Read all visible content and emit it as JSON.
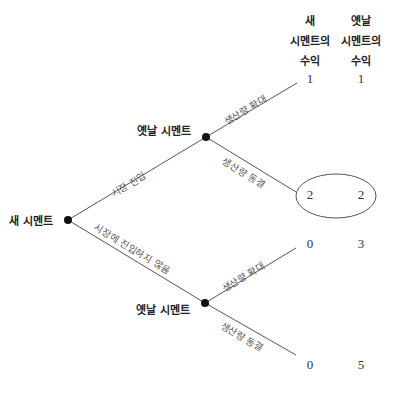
{
  "headers": {
    "new_cement": [
      "새",
      "시멘트의",
      "수익"
    ],
    "old_cement": [
      "옛날",
      "시멘트의",
      "수익"
    ]
  },
  "nodes": {
    "root": {
      "label": "새 시멘트"
    },
    "upper": {
      "label": "옛날 시멘트"
    },
    "lower": {
      "label": "옛날 시멘트"
    }
  },
  "branches": {
    "enter": "시장 진입",
    "not_enter": "시장에 진입하지 않음",
    "upper_expand": "생산량 확대",
    "upper_freeze": "생산량 동결",
    "lower_expand": "생산량 확대",
    "lower_freeze": "생산량 동결"
  },
  "payoffs": [
    {
      "outcome": "enter-expand",
      "new": "1",
      "old": "1",
      "highlighted": false
    },
    {
      "outcome": "enter-freeze",
      "new": "2",
      "old": "2",
      "highlighted": true
    },
    {
      "outcome": "not_enter-expand",
      "new": "0",
      "old": "3",
      "highlighted": false
    },
    {
      "outcome": "not_enter-freeze",
      "new": "0",
      "old": "5",
      "highlighted": false
    }
  ],
  "colors": {
    "line": "#555555",
    "node": "#111111",
    "text": "#222222"
  }
}
